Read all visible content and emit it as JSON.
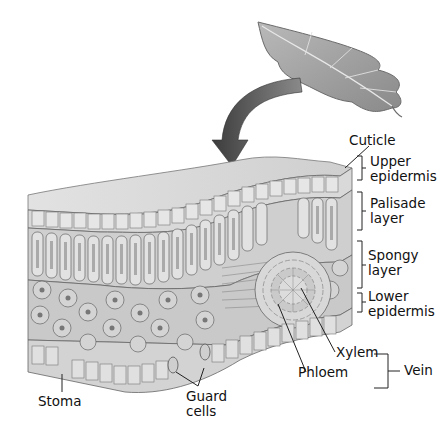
{
  "diagram": {
    "labels": {
      "cuticle": "Cuticle",
      "upper_epidermis": [
        "Upper",
        "epidermis"
      ],
      "palisade_layer": [
        "Palisade",
        "layer"
      ],
      "spongy_layer": [
        "Spongy",
        "layer"
      ],
      "lower_epidermis": [
        "Lower",
        "epidermis"
      ],
      "xylem": "Xylem",
      "phloem": "Phloem",
      "vein": "Vein",
      "stoma": "Stoma",
      "guard_cells": [
        "Guard",
        "cells"
      ]
    },
    "colors": {
      "background": "#ffffff",
      "cell_fill": "#d6d6d6",
      "cell_stroke": "#555555",
      "arrow": "#4a4a4a",
      "leaf": "#9a9a9a",
      "text": "#111111"
    }
  }
}
